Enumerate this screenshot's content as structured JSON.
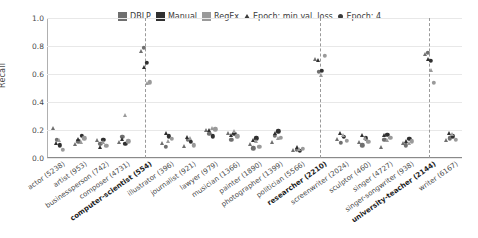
{
  "chart_data": {
    "type": "scatter",
    "title": "",
    "xlabel": "",
    "ylabel": "Recall",
    "ylim": [
      0.0,
      1.0
    ],
    "yticks": [
      0.0,
      0.2,
      0.4,
      0.6,
      0.8,
      1.0
    ],
    "ytick_labels": [
      "0.0",
      "0.2",
      "0.4",
      "0.6",
      "0.8",
      "1.0"
    ],
    "grid": true,
    "legend_position": "top-center",
    "legend": [
      {
        "label": "DBLP",
        "marker": "square",
        "color": "#6f6f6f"
      },
      {
        "label": "Manual",
        "marker": "square",
        "color": "#303030"
      },
      {
        "label": "RegEx",
        "marker": "square",
        "color": "#9a9a9a"
      },
      {
        "label": "Epoch: min val. loss",
        "marker": "triangle",
        "color": "#3b3b3b"
      },
      {
        "label": "Epoch: 4",
        "marker": "circle",
        "color": "#3b3b3b"
      }
    ],
    "highlight_categories": [
      "computer-scientist (554)",
      "researcher (2210)",
      "university-teacher (2144)"
    ],
    "categories": [
      "actor (5238)",
      "artist (953)",
      "businessperson (742)",
      "composer (4731)",
      "computer-scientist (554)",
      "illustrator (396)",
      "journalist (921)",
      "lawyer (979)",
      "musician (1366)",
      "painter (1890)",
      "photographer (1399)",
      "politician (5566)",
      "researcher (2210)",
      "screenwriter (2024)",
      "sculptor (460)",
      "singer (4727)",
      "singer-songwriter (938)",
      "university-teacher (2144)",
      "writer (6167)"
    ],
    "series": [
      {
        "name": "DBLP",
        "color": "#6f6f6f",
        "epoch_min_val_loss": [
          0.21,
          0.09,
          0.12,
          0.11,
          0.76,
          0.1,
          0.08,
          0.19,
          0.17,
          0.09,
          0.11,
          0.05,
          0.7,
          0.13,
          0.11,
          0.07,
          0.1,
          0.735,
          0.12
        ],
        "epoch_4": [
          0.13,
          0.12,
          0.1,
          0.15,
          0.785,
          0.08,
          0.13,
          0.175,
          0.13,
          0.07,
          0.16,
          0.06,
          0.615,
          0.11,
          0.09,
          0.13,
          0.09,
          0.75,
          0.14
        ]
      },
      {
        "name": "Manual",
        "color": "#303030",
        "epoch_min_val_loss": [
          0.1,
          0.13,
          0.07,
          0.13,
          0.64,
          0.175,
          0.14,
          0.195,
          0.155,
          0.12,
          0.175,
          0.075,
          0.695,
          0.175,
          0.16,
          0.155,
          0.115,
          0.7,
          0.175
        ],
        "epoch_4": [
          0.09,
          0.16,
          0.13,
          0.1,
          0.68,
          0.155,
          0.115,
          0.155,
          0.175,
          0.14,
          0.19,
          0.05,
          0.625,
          0.15,
          0.14,
          0.165,
          0.135,
          0.695,
          0.155
        ]
      },
      {
        "name": "RegEx",
        "color": "#9a9a9a",
        "epoch_min_val_loss": [
          0.12,
          0.11,
          0.11,
          0.3,
          0.53,
          0.115,
          0.135,
          0.21,
          0.185,
          0.115,
          0.135,
          0.055,
          0.585,
          0.155,
          0.135,
          0.125,
          0.1,
          0.625,
          0.165
        ],
        "epoch_4": [
          0.06,
          0.14,
          0.085,
          0.12,
          0.54,
          0.135,
          0.09,
          0.205,
          0.155,
          0.08,
          0.145,
          0.065,
          0.73,
          0.125,
          0.115,
          0.145,
          0.12,
          0.535,
          0.13
        ]
      }
    ]
  }
}
